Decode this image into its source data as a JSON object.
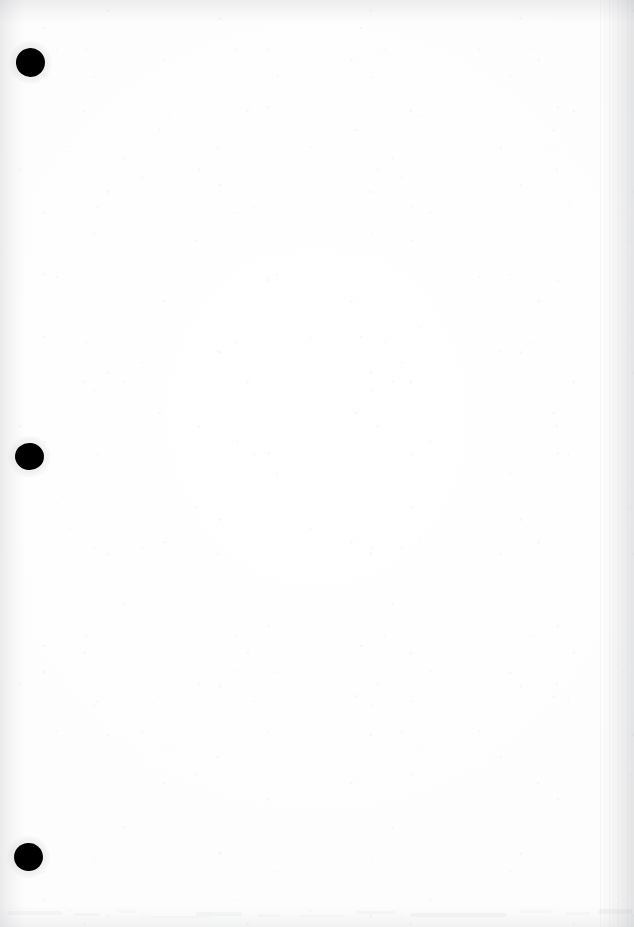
{
  "document": {
    "kind": "scanned-blank-page",
    "description": "Blank scanned sheet of paper with three black binder hole punches along the left margin",
    "page_width": 634,
    "page_height": 927,
    "text_content": "",
    "visible_text_blocks": []
  },
  "colors": {
    "page_background": "#fefefe",
    "paper_tone": "#ffffff",
    "hole_punch": "#000000",
    "edge_mottle": "#8c8e94",
    "smudge": "#969aa0"
  },
  "hole_punches": [
    {
      "name": "hole-punch-top",
      "cx": 30,
      "cy": 62,
      "rx": 14.5,
      "ry": 14.5,
      "rotate": -8
    },
    {
      "name": "hole-punch-middle",
      "cx": 29,
      "cy": 456,
      "rx": 14.5,
      "ry": 13.5,
      "rotate": 6
    },
    {
      "name": "hole-punch-bottom",
      "cx": 28,
      "cy": 857,
      "rx": 14.5,
      "ry": 14.0,
      "rotate": -4
    }
  ],
  "bottom_smudges": [
    {
      "left": 8,
      "top": 3,
      "width": 54,
      "height": 4,
      "opacity": 0.3
    },
    {
      "left": 74,
      "top": 5,
      "width": 26,
      "height": 3,
      "opacity": 0.22
    },
    {
      "left": 118,
      "top": 2,
      "width": 18,
      "height": 3,
      "opacity": 0.18
    },
    {
      "left": 196,
      "top": 4,
      "width": 46,
      "height": 4,
      "opacity": 0.26
    },
    {
      "left": 258,
      "top": 6,
      "width": 22,
      "height": 3,
      "opacity": 0.2
    },
    {
      "left": 356,
      "top": 3,
      "width": 40,
      "height": 3,
      "opacity": 0.24
    },
    {
      "left": 410,
      "top": 5,
      "width": 96,
      "height": 4,
      "opacity": 0.28
    },
    {
      "left": 520,
      "top": 2,
      "width": 30,
      "height": 3,
      "opacity": 0.2
    },
    {
      "left": 566,
      "top": 4,
      "width": 24,
      "height": 3,
      "opacity": 0.18
    },
    {
      "left": 598,
      "top": 1,
      "width": 34,
      "height": 5,
      "opacity": 0.32
    },
    {
      "left": 150,
      "top": 8,
      "width": 60,
      "height": 2,
      "opacity": 0.14
    },
    {
      "left": 300,
      "top": 7,
      "width": 44,
      "height": 2,
      "opacity": 0.16
    }
  ]
}
